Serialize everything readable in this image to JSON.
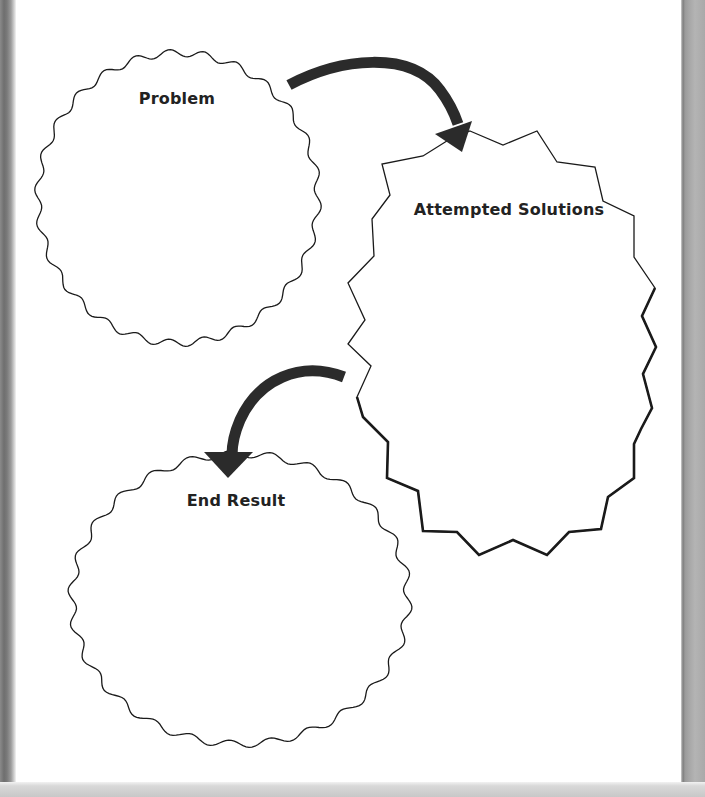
{
  "worksheet": {
    "type": "graphic-organizer",
    "nodes": [
      {
        "id": "problem",
        "label": "Problem",
        "shape": "wavy-circle"
      },
      {
        "id": "attempted",
        "label": "Attempted Solutions",
        "shape": "zigzag-burst"
      },
      {
        "id": "end",
        "label": "End Result",
        "shape": "wavy-circle"
      }
    ],
    "edges": [
      {
        "from": "problem",
        "to": "attempted",
        "style": "thick-arrow"
      },
      {
        "from": "attempted",
        "to": "end",
        "style": "thick-arrow"
      }
    ]
  },
  "colors": {
    "ink": "#222222",
    "outline": "#1a1a1a",
    "arrow": "#2b2b2b",
    "page": "#ffffff"
  }
}
